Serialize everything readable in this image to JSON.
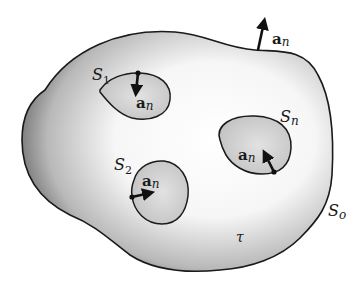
{
  "figure": {
    "colors": {
      "outline": "#1a1a1a",
      "shade_dark": "#3a3a3a",
      "shade_light": "#ffffff",
      "hole_fill": "#cfcfcf",
      "arrow": "#111111"
    }
  },
  "labels": {
    "outer_surface": {
      "main": "S",
      "sub": "o"
    },
    "surface_1": {
      "main": "S",
      "sub": "1"
    },
    "surface_2": {
      "main": "S",
      "sub": "2"
    },
    "surface_n": {
      "main": "S",
      "sub": "n"
    },
    "volume": "τ",
    "normal_outer": {
      "main": "a",
      "sub": "n"
    },
    "normal_1": {
      "main": "a",
      "sub": "n"
    },
    "normal_2": {
      "main": "a",
      "sub": "n"
    },
    "normal_n": {
      "main": "a",
      "sub": "n"
    }
  }
}
